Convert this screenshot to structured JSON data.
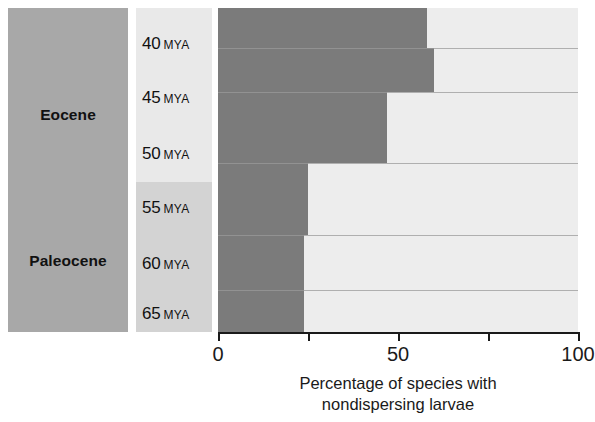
{
  "figure": {
    "name": "nondispersing-larvae-through-time"
  },
  "epochs": [
    {
      "label": "Eocene",
      "top": 0,
      "height": 174
    },
    {
      "label": "Paleocene",
      "top": 174,
      "height": 150
    }
  ],
  "axis": {
    "tick_labels": [
      "0",
      "50",
      "100"
    ],
    "tick_values": [
      0,
      25,
      50,
      75,
      100
    ],
    "title_line1": "Percentage of species with",
    "title_line2": "nondispersing larvae",
    "min": 0,
    "max": 100
  },
  "colors": {
    "epoch_block": "#a8a8a8",
    "mya_eocene_bg": "#e9e9e9",
    "mya_paleocene_bg": "#d3d3d3",
    "bar_fill": "#7b7b7b",
    "bar_track": "#ededed",
    "axis": "#1a1a1a"
  },
  "chart_data": {
    "type": "bar",
    "orientation": "horizontal",
    "title": "",
    "xlabel": "Percentage of species with nondispersing larvae",
    "ylabel": "",
    "xlim": [
      0,
      100
    ],
    "grid": false,
    "legend": "none",
    "categories": [
      "40 MYA",
      "45 MYA",
      "50 MYA",
      "55 MYA",
      "60 MYA",
      "65 MYA"
    ],
    "category_numbers": [
      40,
      45,
      50,
      55,
      60,
      65
    ],
    "category_units": [
      "MYA",
      "MYA",
      "MYA",
      "MYA",
      "MYA",
      "MYA"
    ],
    "values": [
      58,
      60,
      47,
      25,
      24,
      24
    ],
    "series": [
      {
        "name": "Percentage of species with nondispersing larvae",
        "values": [
          58,
          60,
          47,
          25,
          24,
          24
        ]
      }
    ],
    "epoch_groups": [
      {
        "name": "Eocene",
        "categories": [
          "40 MYA",
          "45 MYA",
          "50 MYA"
        ]
      },
      {
        "name": "Paleocene",
        "categories": [
          "55 MYA",
          "60 MYA",
          "65 MYA"
        ]
      }
    ],
    "bands": [
      {
        "label": "40 MYA",
        "value": 58,
        "top": 0,
        "height": 40
      },
      {
        "label": "45 MYA",
        "value": 60,
        "top": 40,
        "height": 44
      },
      {
        "label": "50 MYA",
        "value": 47,
        "top": 84,
        "height": 71
      },
      {
        "label": "55 MYA",
        "value": 25,
        "top": 155,
        "height": 72
      },
      {
        "label": "60 MYA",
        "value": 24,
        "top": 227,
        "height": 55
      },
      {
        "label": "65 MYA",
        "value": 24,
        "top": 282,
        "height": 42
      }
    ],
    "label_positions": [
      {
        "label": "40 MYA",
        "top": 26
      },
      {
        "label": "45 MYA",
        "top": 80
      },
      {
        "label": "50 MYA",
        "top": 136
      },
      {
        "label": "55 MYA",
        "top": 190
      },
      {
        "label": "60 MYA",
        "top": 246
      },
      {
        "label": "65 MYA",
        "top": 296
      }
    ]
  }
}
